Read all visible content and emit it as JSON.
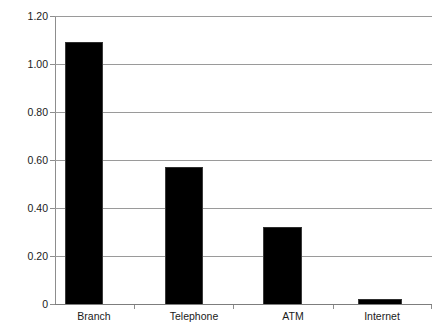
{
  "chart_data": {
    "type": "bar",
    "title": "",
    "xlabel": "",
    "ylabel": "",
    "categories": [
      "Branch",
      "Telephone",
      "ATM",
      "Internet"
    ],
    "values": [
      1.09,
      0.57,
      0.32,
      0.02
    ],
    "ylim": [
      0,
      1.2
    ],
    "ytick_values": [
      1.2,
      1.0,
      0.8,
      0.6,
      0.4,
      0.2,
      0
    ],
    "ytick_labels": [
      "1.20",
      "1.00",
      "0.80",
      "0.60",
      "0.40",
      "0.20",
      "0"
    ],
    "grid": true,
    "legend": false,
    "bar_color": "#000000",
    "gridline_color": "#9a9a9a",
    "axis_color": "#8d8d8d",
    "text_color": "#1a1a1a"
  }
}
